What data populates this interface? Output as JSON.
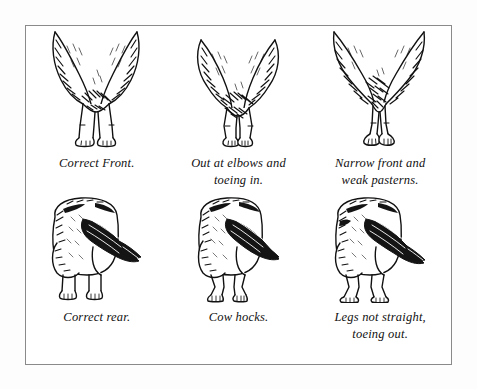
{
  "plate": {
    "border_color": "#8a8a8a",
    "background_color": "#ffffff",
    "ink_color": "#111111",
    "columns": 3,
    "rows": 2
  },
  "panels": [
    {
      "id": "front-correct",
      "row": "front",
      "column": 1,
      "caption": "Correct Front.",
      "figure_name": "dog-front-legs-correct"
    },
    {
      "id": "front-out-at-elbows",
      "row": "front",
      "column": 2,
      "caption": "Out at elbows and\ntoeing in.",
      "figure_name": "dog-front-legs-out-at-elbows"
    },
    {
      "id": "front-narrow",
      "row": "front",
      "column": 3,
      "caption": "Narrow front and\nweak pasterns.",
      "figure_name": "dog-front-legs-narrow-weak-pasterns"
    },
    {
      "id": "rear-correct",
      "row": "rear",
      "column": 1,
      "caption": "Correct rear.",
      "figure_name": "dog-rear-legs-correct"
    },
    {
      "id": "rear-cow-hocks",
      "row": "rear",
      "column": 2,
      "caption": "Cow hocks.",
      "figure_name": "dog-rear-legs-cow-hocks"
    },
    {
      "id": "rear-legs-not-straight",
      "row": "rear",
      "column": 3,
      "caption": "Legs not straight,\ntoeing out.",
      "figure_name": "dog-rear-legs-toeing-out"
    }
  ]
}
